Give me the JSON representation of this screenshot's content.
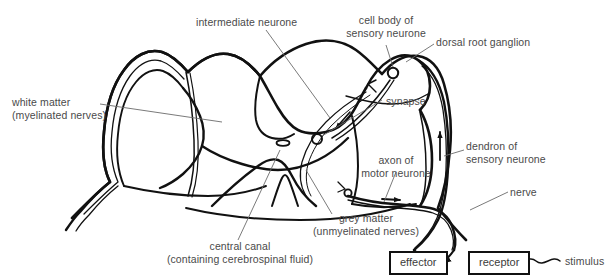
{
  "figure": {
    "background_color": "#ffffff",
    "ink_color": "#111111",
    "text_color": "#4a4a4a",
    "leader_line_color": "#6b6b6b"
  },
  "labels": {
    "intermediate_neurone": "intermediate neurone",
    "cell_body_line1": "cell body of",
    "cell_body_line2": "sensory neurone",
    "dorsal_root_ganglion": "dorsal root ganglion",
    "white_matter_line1": "white matter",
    "white_matter_line2": "(myelinated nerves)",
    "synapse": "synapse",
    "axon_line1": "axon of",
    "axon_line2": "motor neurone",
    "dendron_line1": "dendron of",
    "dendron_line2": "sensory neurone",
    "nerve": "nerve",
    "grey_matter_line1": "grey matter",
    "grey_matter_line2": "(unmyelinated nerves)",
    "central_canal_line1": "central canal",
    "central_canal_line2": "(containing cerebrospinal fluid)",
    "stimulus": "stimulus"
  },
  "boxes": {
    "effector": "effector",
    "receptor": "receptor"
  },
  "structures": {
    "spinal_cord_outline": "spinal cord cross-section outer membrane",
    "grey_matter_shape": "butterfly shaped grey matter",
    "central_canal_shape": "small central oval canal",
    "ganglion_shape": "dorsal root ganglion bulge",
    "sensory_cell_body_marker": "small circle in ganglion",
    "synapse_marker": "small circle at synapse junction",
    "motor_synapse_marker": "small circle at motor neurone junction"
  },
  "arrows": {
    "dendron_up": "impulse travelling up dendron toward ganglion",
    "into_grey_matter": "impulse entering grey matter",
    "intermediate_down": "impulse along intermediate neurone",
    "axon_out": "impulse leaving along motor axon"
  }
}
